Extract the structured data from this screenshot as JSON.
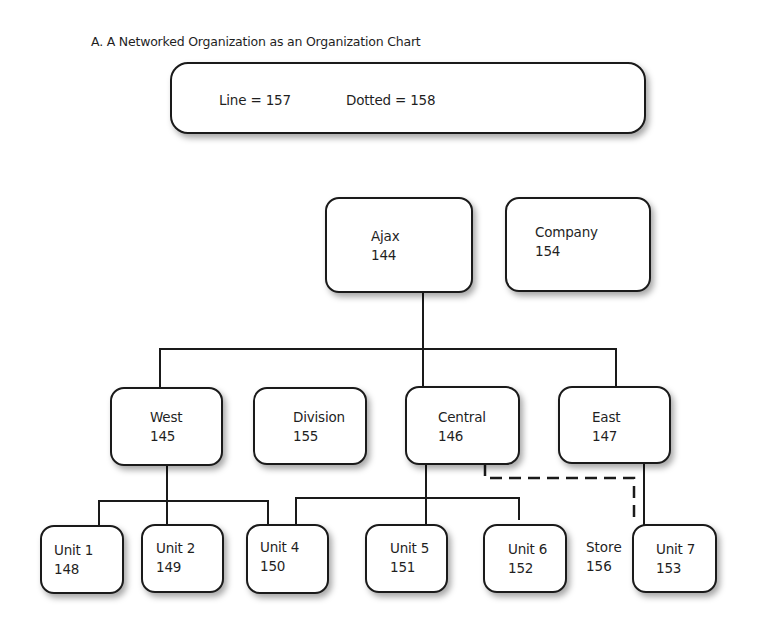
{
  "title": "A. A Networked Organization as an Organization Chart",
  "legend": {
    "line_label": "Line = 157",
    "dotted_label": "Dotted = 158"
  },
  "nodes": {
    "ajax": {
      "name": "Ajax",
      "num": "144"
    },
    "company": {
      "name": "Company",
      "num": "154"
    },
    "west": {
      "name": "West",
      "num": "145"
    },
    "division": {
      "name": "Division",
      "num": "155"
    },
    "central": {
      "name": "Central",
      "num": "146"
    },
    "east": {
      "name": "East",
      "num": "147"
    },
    "unit1": {
      "name": "Unit 1",
      "num": "148"
    },
    "unit2": {
      "name": "Unit 2",
      "num": "149"
    },
    "unit4": {
      "name": "Unit 4",
      "num": "150"
    },
    "unit5": {
      "name": "Unit 5",
      "num": "151"
    },
    "unit6": {
      "name": "Unit 6",
      "num": "152"
    },
    "unit7": {
      "name": "Unit 7",
      "num": "153"
    }
  },
  "store": {
    "name": "Store",
    "num": "156"
  },
  "edges": {
    "solid": [
      [
        "Ajax",
        "West"
      ],
      [
        "Ajax",
        "Central"
      ],
      [
        "Ajax",
        "East"
      ],
      [
        "West",
        "Unit 1"
      ],
      [
        "West",
        "Unit 2"
      ],
      [
        "West",
        "Unit 4"
      ],
      [
        "Central",
        "Unit 4"
      ],
      [
        "Central",
        "Unit 5"
      ],
      [
        "Central",
        "Unit 6"
      ],
      [
        "East",
        "Unit 7"
      ]
    ],
    "dotted": [
      [
        "Central",
        "Unit 7"
      ]
    ]
  }
}
